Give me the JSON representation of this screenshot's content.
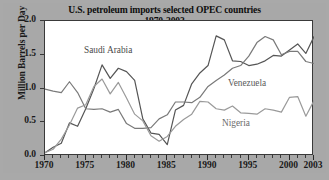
{
  "chart_data": {
    "type": "line",
    "title": "U.S. petroleum imports selected OPEC countries",
    "subtitle": "1970-2003",
    "xlabel": "",
    "ylabel": "Million Barrels per Day",
    "xlim": [
      1970,
      2003
    ],
    "ylim": [
      0.0,
      2.0
    ],
    "yticks": [
      "0.0",
      "0.5",
      "1.0",
      "1.5",
      "2.0"
    ],
    "ytick_values": [
      0.0,
      0.5,
      1.0,
      1.5,
      2.0
    ],
    "xticks": [
      "1970",
      "1975",
      "1980",
      "1985",
      "1990",
      "1995",
      "2000",
      "2003"
    ],
    "xtick_values": [
      1970,
      1975,
      1980,
      1985,
      1990,
      1995,
      2000,
      2003
    ],
    "grid": false,
    "legend": "inline annotations",
    "x": [
      1970,
      1971,
      1972,
      1973,
      1974,
      1975,
      1976,
      1977,
      1978,
      1979,
      1980,
      1981,
      1982,
      1983,
      1984,
      1985,
      1986,
      1987,
      1988,
      1989,
      1990,
      1991,
      1992,
      1993,
      1994,
      1995,
      1996,
      1997,
      1998,
      1999,
      2000,
      2001,
      2002,
      2003
    ],
    "series": [
      {
        "name": "Saudi Arabia",
        "color": "#555555",
        "values": [
          0.05,
          0.13,
          0.19,
          0.49,
          0.44,
          0.7,
          1.0,
          1.35,
          1.15,
          1.3,
          1.25,
          1.12,
          0.55,
          0.34,
          0.32,
          0.17,
          0.68,
          0.75,
          1.07,
          1.23,
          1.34,
          1.78,
          1.72,
          1.41,
          1.4,
          1.34,
          1.36,
          1.41,
          1.49,
          1.48,
          1.57,
          1.66,
          1.52,
          1.77
        ]
      },
      {
        "name": "Venezuela",
        "color": "#7a7a7a",
        "values": [
          0.99,
          0.96,
          0.94,
          1.1,
          0.94,
          0.7,
          0.69,
          0.7,
          0.65,
          0.69,
          0.48,
          0.41,
          0.41,
          0.42,
          0.55,
          0.61,
          0.8,
          0.8,
          0.79,
          0.87,
          1.03,
          1.12,
          1.2,
          1.3,
          1.34,
          1.48,
          1.68,
          1.77,
          1.72,
          1.5,
          1.55,
          1.55,
          1.4,
          1.37
        ]
      },
      {
        "name": "Nigeria",
        "color": "#9a9a9a",
        "values": [
          0.05,
          0.1,
          0.25,
          0.46,
          0.71,
          0.76,
          1.03,
          1.14,
          0.92,
          1.09,
          0.86,
          0.62,
          0.52,
          0.3,
          0.22,
          0.29,
          0.44,
          0.54,
          0.62,
          0.81,
          0.8,
          0.7,
          0.68,
          0.74,
          0.64,
          0.63,
          0.62,
          0.7,
          0.68,
          0.65,
          0.87,
          0.88,
          0.59,
          0.82
        ]
      }
    ]
  },
  "labels": {
    "saudi": "Saudi Arabia",
    "venezuela": "Venezuela",
    "nigeria": "Nigeria"
  }
}
